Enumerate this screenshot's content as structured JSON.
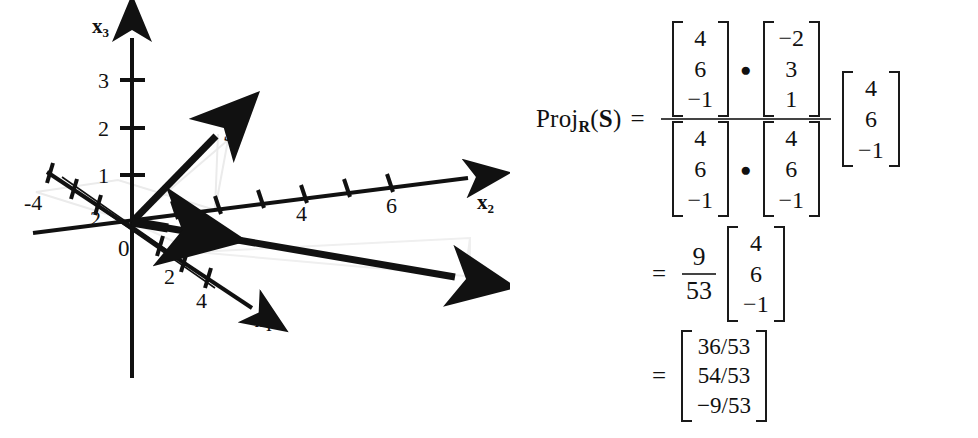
{
  "diagram": {
    "axes": [
      {
        "name": "x3",
        "label": "x",
        "sub": "3"
      },
      {
        "name": "x2",
        "label": "x",
        "sub": "2"
      },
      {
        "name": "x1",
        "label": "x",
        "sub": "1"
      }
    ],
    "origin_label": "0",
    "tick_labels": {
      "x3": [
        "1",
        "2",
        "3"
      ],
      "x2": [
        "2",
        "4",
        "6"
      ],
      "x1": [
        "2",
        "4"
      ],
      "x1_negative": [
        "2",
        "-4"
      ]
    },
    "vectors": [
      {
        "name": "S",
        "label": "S"
      },
      {
        "name": "R",
        "label": "R"
      }
    ]
  },
  "formula": {
    "lhs_proj": "Proj",
    "lhs_sub": "R",
    "lhs_open": "(",
    "lhs_arg": "S",
    "lhs_close": ")",
    "equals": "=",
    "dot_operator": "●",
    "numerator": {
      "left_vector": [
        "4",
        "6",
        "−1"
      ],
      "right_vector": [
        "−2",
        "3",
        "1"
      ]
    },
    "denominator": {
      "left_vector": [
        "4",
        "6",
        "−1"
      ],
      "right_vector": [
        "4",
        "6",
        "−1"
      ]
    },
    "trailing_vector": [
      "4",
      "6",
      "−1"
    ],
    "line2": {
      "equals": "=",
      "scalar_num": "9",
      "scalar_den": "53",
      "vector": [
        "4",
        "6",
        "−1"
      ]
    },
    "line3": {
      "equals": "=",
      "vector": [
        "36/53",
        "54/53",
        "−9/53"
      ]
    }
  },
  "colors": {
    "ink": "#111111",
    "construction_line": "#e8e8e8",
    "fraction_bar": "#444444"
  }
}
